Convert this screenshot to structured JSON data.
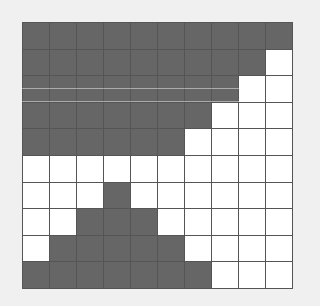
{
  "board": {
    "rows": 10,
    "cols": 10,
    "colors": {
      "filled": "#666666",
      "empty": "#ffffff",
      "grid_line": "#555555",
      "background": "#f0f0f0"
    },
    "cells": [
      [
        1,
        1,
        1,
        1,
        1,
        1,
        1,
        1,
        1,
        1
      ],
      [
        1,
        1,
        1,
        1,
        1,
        1,
        1,
        1,
        1,
        0
      ],
      [
        1,
        1,
        1,
        1,
        1,
        1,
        1,
        1,
        0,
        0
      ],
      [
        1,
        1,
        1,
        1,
        1,
        1,
        1,
        0,
        0,
        0
      ],
      [
        1,
        1,
        1,
        1,
        1,
        1,
        0,
        0,
        0,
        0
      ],
      [
        0,
        0,
        0,
        0,
        0,
        0,
        0,
        0,
        0,
        0
      ],
      [
        0,
        0,
        0,
        1,
        0,
        0,
        0,
        0,
        0,
        0
      ],
      [
        0,
        0,
        1,
        1,
        1,
        0,
        0,
        0,
        0,
        0
      ],
      [
        0,
        1,
        1,
        1,
        1,
        1,
        0,
        0,
        0,
        0
      ],
      [
        1,
        1,
        1,
        1,
        1,
        1,
        1,
        0,
        0,
        0
      ]
    ]
  }
}
